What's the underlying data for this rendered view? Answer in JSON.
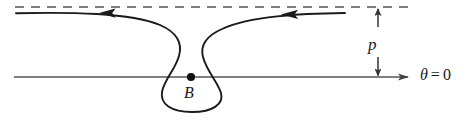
{
  "figure": {
    "type": "scattering-trajectory-diagram",
    "background_color": "#ffffff",
    "stroke_color": "#1a1a1a",
    "labels": {
      "impact_parameter": "p",
      "center_point": "B",
      "axis_angle_symbol": "θ",
      "axis_angle_equals": "=",
      "axis_angle_value": "0",
      "axis_angle_full": "θ = 0"
    },
    "elements": {
      "dashed_asymptote_name": "dashed asymptote line",
      "polar_axis_name": "polar axis theta = 0",
      "trajectory_name": "particle trajectory",
      "loop_name": "orbit loop around B",
      "center_dot_name": "focus point B",
      "impact_parameter_name": "impact parameter p measurement"
    },
    "geometry": {
      "dashed_line_y": 7,
      "dashed_line_x_start": 15,
      "dashed_line_x_end": 410,
      "axis_y": 77,
      "axis_x_start": 14,
      "axis_x_end": 412,
      "center_x": 191,
      "center_y": 77,
      "loop_left_x": 162,
      "loop_right_x": 222,
      "loop_bottom_y": 112,
      "crossing_x": 189,
      "crossing_y": 37,
      "arrow_left_x": 105,
      "arrow_right_x": 297,
      "p_measure_x": 378
    }
  }
}
